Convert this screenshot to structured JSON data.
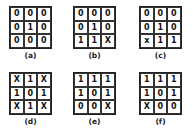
{
  "panels": [
    {
      "label": "(a)",
      "cells": [
        "0",
        "0",
        "0",
        "0",
        "1",
        "0",
        "0",
        "0",
        "0"
      ]
    },
    {
      "label": "(b)",
      "cells": [
        "0",
        "0",
        "0",
        "0",
        "1",
        "0",
        "1",
        "1",
        "X"
      ]
    },
    {
      "label": "(c)",
      "cells": [
        "0",
        "0",
        "0",
        "0",
        "1",
        "0",
        "x",
        "1",
        "1"
      ]
    },
    {
      "label": "(d)",
      "cells": [
        "X",
        "1",
        "X",
        "1",
        "0",
        "1",
        "X",
        "1",
        "X"
      ]
    },
    {
      "label": "(e)",
      "cells": [
        "1",
        "1",
        "1",
        "1",
        "0",
        "1",
        "0",
        "0",
        "X"
      ]
    },
    {
      "label": "(f)",
      "cells": [
        "1",
        "1",
        "1",
        "1",
        "0",
        "1",
        "X",
        "0",
        "0"
      ]
    }
  ]
}
